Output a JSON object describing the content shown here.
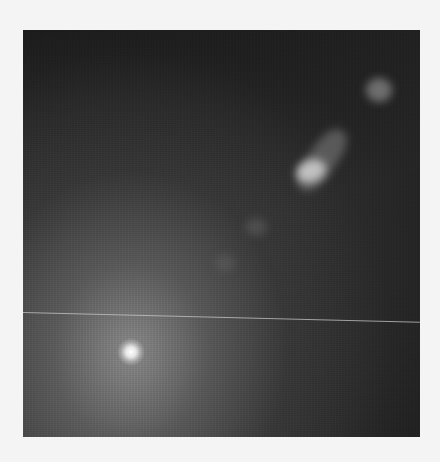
{
  "image": {
    "subject": "galaxy with bright nucleus and jet",
    "frame": {
      "x": 23,
      "y": 30,
      "width": 397,
      "height": 407
    },
    "colors": {
      "background": "#f4f4f4",
      "sky": "#141414",
      "core": "#ffffff",
      "halo": "#969696"
    },
    "features": [
      {
        "name": "nucleus",
        "x": 131,
        "y": 352
      },
      {
        "name": "jet-knot-bright",
        "x": 310,
        "y": 172
      },
      {
        "name": "jet-knot-outer",
        "x": 380,
        "y": 92
      },
      {
        "name": "jet-knot-faint-1",
        "x": 255,
        "y": 230
      },
      {
        "name": "jet-knot-faint-2",
        "x": 225,
        "y": 265
      }
    ],
    "artifact_line": {
      "x1": 23,
      "y1": 312,
      "x2": 420,
      "y2": 322
    }
  }
}
